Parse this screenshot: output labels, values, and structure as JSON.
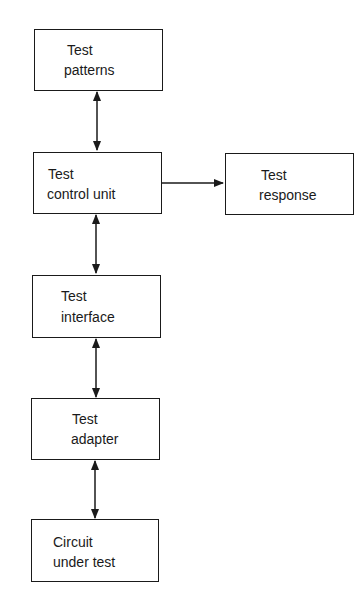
{
  "diagram": {
    "type": "block-diagram",
    "blocks": [
      {
        "id": "patterns",
        "line1": "Test",
        "line2": "patterns"
      },
      {
        "id": "control",
        "line1": "Test",
        "line2": "control unit"
      },
      {
        "id": "response",
        "line1": "Test",
        "line2": "response"
      },
      {
        "id": "interface",
        "line1": "Test",
        "line2": "interface"
      },
      {
        "id": "adapter",
        "line1": "Test",
        "line2": "adapter"
      },
      {
        "id": "cut",
        "line1": "Circuit",
        "line2": "under test"
      }
    ],
    "connections": [
      {
        "from": "patterns",
        "to": "control",
        "direction": "bidirectional"
      },
      {
        "from": "control",
        "to": "response",
        "direction": "forward"
      },
      {
        "from": "control",
        "to": "interface",
        "direction": "bidirectional"
      },
      {
        "from": "interface",
        "to": "adapter",
        "direction": "bidirectional"
      },
      {
        "from": "adapter",
        "to": "cut",
        "direction": "bidirectional"
      }
    ]
  }
}
